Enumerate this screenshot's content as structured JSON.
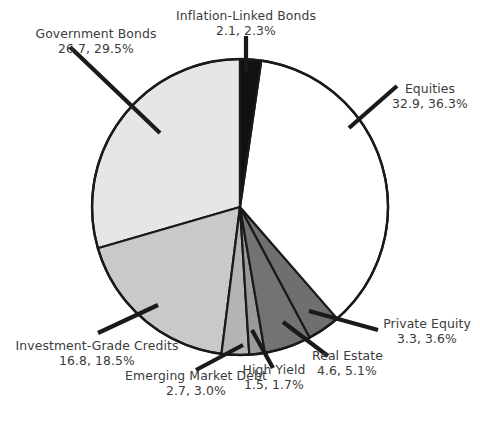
{
  "chart_data": {
    "type": "pie",
    "title": "",
    "subtitle": "",
    "xlabel": "",
    "ylabel": "",
    "legend_position": "callout-labels",
    "grid": false,
    "value_unit": "",
    "start_angle_deg": 0,
    "direction": "clockwise",
    "categories": [
      "Inflation-Linked Bonds",
      "Equities",
      "Private Equity",
      "Real Estate",
      "High Yield",
      "Emerging Market Debt",
      "Investment-Grade Credits",
      "Government Bonds"
    ],
    "values": [
      2.1,
      32.9,
      3.3,
      4.6,
      1.5,
      2.7,
      16.8,
      26.7
    ],
    "percents": [
      2.3,
      36.3,
      3.6,
      5.1,
      1.7,
      3.0,
      18.5,
      29.5
    ],
    "colors": [
      "#111111",
      "#ffffff",
      "#6f6f6f",
      "#737373",
      "#9a9a9a",
      "#b4b4b4",
      "#c9c9c9",
      "#e6e6e6"
    ],
    "slices": [
      {
        "name": "Inflation-Linked Bonds",
        "value": 2.1,
        "percent": 2.3,
        "color": "#111111",
        "value_text": "2.1, 2.3%"
      },
      {
        "name": "Equities",
        "value": 32.9,
        "percent": 36.3,
        "color": "#ffffff",
        "value_text": "32.9, 36.3%"
      },
      {
        "name": "Private Equity",
        "value": 3.3,
        "percent": 3.6,
        "color": "#6f6f6f",
        "value_text": "3.3, 3.6%"
      },
      {
        "name": "Real Estate",
        "value": 4.6,
        "percent": 5.1,
        "color": "#737373",
        "value_text": "4.6, 5.1%"
      },
      {
        "name": "High Yield",
        "value": 1.5,
        "percent": 1.7,
        "color": "#9a9a9a",
        "value_text": "1.5, 1.7%"
      },
      {
        "name": "Emerging Market Debt",
        "value": 2.7,
        "percent": 3.0,
        "color": "#b4b4b4",
        "value_text": "2.7, 3.0%"
      },
      {
        "name": "Investment-Grade Credits",
        "value": 16.8,
        "percent": 18.5,
        "color": "#c9c9c9",
        "value_text": "16.8, 18.5%"
      },
      {
        "name": "Government Bonds",
        "value": 26.7,
        "percent": 29.5,
        "color": "#e6e6e6",
        "value_text": "26.7, 29.5%"
      }
    ]
  },
  "labels": {
    "inflation_linked_bonds": {
      "name": "Inflation-Linked Bonds",
      "value_text": "2.1, 2.3%"
    },
    "government_bonds": {
      "name": "Government Bonds",
      "value_text": "26.7, 29.5%"
    },
    "equities": {
      "name": "Equities",
      "value_text": "32.9, 36.3%"
    },
    "private_equity": {
      "name": "Private Equity",
      "value_text": "3.3, 3.6%"
    },
    "real_estate": {
      "name": "Real Estate",
      "value_text": "4.6, 5.1%"
    },
    "high_yield": {
      "name": "High Yield",
      "value_text": "1.5, 1.7%"
    },
    "emerging_market_debt": {
      "name": "Emerging Market Debt",
      "value_text": "2.7, 3.0%"
    },
    "investment_grade_credits": {
      "name": "Investment-Grade Credits",
      "value_text": "16.8, 18.5%"
    }
  },
  "style": {
    "outline_color": "#1a1a1a",
    "leader_color": "#1a1a1a",
    "text_color": "#3b3b3b",
    "background": "#ffffff"
  }
}
